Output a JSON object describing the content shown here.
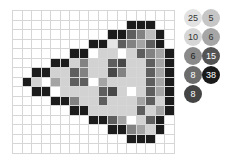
{
  "puzzle": {
    "columns": 17,
    "rows": 15,
    "shade_colors": {
      "0": "#ffffff",
      "1": "#e6e6e6",
      "2": "#d2d2d2",
      "3": "#bcbcbc",
      "4": "#a4a4a4",
      "5": "#828282",
      "6": "#5e5e5e",
      "7": "#484848",
      "8": "#1c1c1c"
    },
    "grid": [
      [
        0,
        0,
        0,
        0,
        0,
        0,
        0,
        0,
        0,
        0,
        0,
        0,
        0,
        0,
        0,
        0,
        0
      ],
      [
        0,
        0,
        0,
        0,
        0,
        0,
        0,
        0,
        0,
        0,
        0,
        0,
        8,
        8,
        8,
        0,
        0
      ],
      [
        0,
        0,
        0,
        0,
        0,
        0,
        0,
        0,
        0,
        0,
        8,
        8,
        6,
        5,
        3,
        8,
        0
      ],
      [
        0,
        0,
        0,
        0,
        0,
        0,
        0,
        0,
        8,
        8,
        1,
        6,
        5,
        4,
        6,
        8,
        0
      ],
      [
        0,
        0,
        0,
        0,
        0,
        0,
        8,
        8,
        0,
        2,
        2,
        0,
        2,
        6,
        5,
        4,
        8
      ],
      [
        0,
        0,
        0,
        0,
        8,
        8,
        2,
        5,
        2,
        2,
        6,
        7,
        2,
        2,
        6,
        4,
        8
      ],
      [
        0,
        0,
        8,
        8,
        2,
        2,
        6,
        5,
        2,
        2,
        7,
        5,
        2,
        2,
        6,
        4,
        8
      ],
      [
        0,
        8,
        2,
        0,
        4,
        2,
        6,
        6,
        0,
        4,
        2,
        2,
        2,
        2,
        6,
        4,
        8
      ],
      [
        0,
        0,
        8,
        8,
        0,
        2,
        2,
        2,
        2,
        6,
        7,
        2,
        0,
        2,
        6,
        4,
        8
      ],
      [
        0,
        0,
        0,
        0,
        8,
        8,
        5,
        2,
        2,
        6,
        2,
        2,
        2,
        4,
        6,
        2,
        8
      ],
      [
        0,
        0,
        0,
        0,
        0,
        0,
        8,
        8,
        2,
        2,
        2,
        2,
        2,
        6,
        2,
        4,
        8
      ],
      [
        0,
        0,
        0,
        0,
        0,
        0,
        0,
        0,
        8,
        8,
        6,
        4,
        0,
        2,
        6,
        8,
        0
      ],
      [
        0,
        0,
        0,
        0,
        0,
        0,
        0,
        0,
        0,
        0,
        8,
        8,
        5,
        4,
        2,
        8,
        0
      ],
      [
        0,
        0,
        0,
        0,
        0,
        0,
        0,
        0,
        0,
        0,
        0,
        0,
        8,
        8,
        8,
        0,
        0
      ],
      [
        0,
        0,
        0,
        0,
        0,
        0,
        0,
        0,
        0,
        0,
        0,
        0,
        0,
        0,
        0,
        0,
        0
      ]
    ]
  },
  "palette": [
    {
      "count": "25",
      "color": "#e2e2e2",
      "text_color": "#333333",
      "x": 0,
      "y": 0
    },
    {
      "count": "5",
      "color": "#c6c6c6",
      "text_color": "#333333",
      "x": 18,
      "y": 0
    },
    {
      "count": "10",
      "color": "#d6d6d6",
      "text_color": "#333333",
      "x": 0,
      "y": 19
    },
    {
      "count": "6",
      "color": "#a6a6a6",
      "text_color": "#333333",
      "x": 18,
      "y": 19
    },
    {
      "count": "6",
      "color": "#8a8a8a",
      "text_color": "#222222",
      "x": 0,
      "y": 38
    },
    {
      "count": "15",
      "color": "#545454",
      "text_color": "#ffffff",
      "x": 18,
      "y": 38
    },
    {
      "count": "8",
      "color": "#6c6c6c",
      "text_color": "#ffffff",
      "x": 0,
      "y": 57
    },
    {
      "count": "38",
      "color": "#1a1a1a",
      "text_color": "#ffffff",
      "x": 18,
      "y": 57
    },
    {
      "count": "8",
      "color": "#444444",
      "text_color": "#ffffff",
      "x": 0,
      "y": 76
    }
  ]
}
